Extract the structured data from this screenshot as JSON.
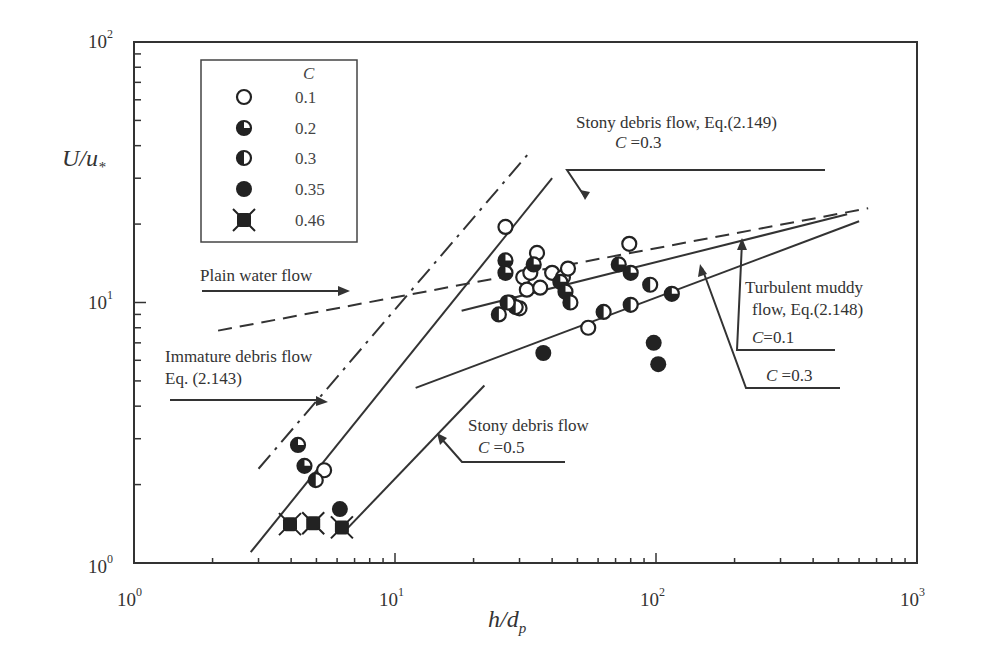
{
  "chart_data": {
    "type": "scatter",
    "title": "",
    "xlabel": "h/d_p",
    "ylabel": "U/u_*",
    "xscale": "log",
    "yscale": "log",
    "xlim": [
      1,
      1000
    ],
    "ylim": [
      1,
      100
    ],
    "x_ticks": [
      "10^0",
      "10^1",
      "10^2",
      "10^3"
    ],
    "y_ticks": [
      "10^0",
      "10^1",
      "10^2"
    ],
    "grid": false,
    "legend": {
      "title": "C",
      "position": "upper-left",
      "entries": [
        {
          "marker": "open-circle",
          "label": "0.1"
        },
        {
          "marker": "quarter-filled-circle",
          "label": "0.2"
        },
        {
          "marker": "half-filled-circle",
          "label": "0.3"
        },
        {
          "marker": "filled-circle",
          "label": "0.35"
        },
        {
          "marker": "filled-star-square",
          "label": "0.46"
        }
      ]
    },
    "series": [
      {
        "name": "C=0.1",
        "marker": "open-circle",
        "points": [
          [
            26.5,
            19.5
          ],
          [
            5.35,
            2.27
          ],
          [
            27.5,
            10
          ],
          [
            30,
            9.5
          ],
          [
            31,
            12.5
          ],
          [
            32,
            11.2
          ],
          [
            33,
            13
          ],
          [
            35,
            15.5
          ],
          [
            36,
            11.4
          ],
          [
            40,
            13
          ],
          [
            44,
            12.5
          ],
          [
            46,
            13.5
          ],
          [
            79,
            16.8
          ],
          [
            55,
            8
          ]
        ]
      },
      {
        "name": "C=0.2",
        "marker": "quarter-filled-circle",
        "points": [
          [
            4.25,
            2.84
          ],
          [
            4.5,
            2.36
          ],
          [
            26.5,
            14.5
          ],
          [
            26.5,
            13
          ],
          [
            34,
            14
          ],
          [
            43,
            12
          ],
          [
            45,
            11
          ],
          [
            72,
            14
          ],
          [
            80,
            13
          ],
          [
            115,
            10.8
          ]
        ]
      },
      {
        "name": "C=0.3",
        "marker": "half-filled-circle",
        "points": [
          [
            4.97,
            2.08
          ],
          [
            25,
            9
          ],
          [
            29,
            9.6
          ],
          [
            47,
            10
          ],
          [
            63,
            9.2
          ],
          [
            80,
            9.8
          ],
          [
            95,
            11.7
          ],
          [
            27,
            10
          ]
        ]
      },
      {
        "name": "C=0.35",
        "marker": "filled-circle",
        "points": [
          [
            6.15,
            1.61
          ],
          [
            37,
            6.4
          ],
          [
            98,
            7.0
          ],
          [
            102,
            5.8
          ]
        ]
      },
      {
        "name": "C=0.46",
        "marker": "filled-star-square",
        "points": [
          [
            3.96,
            1.41
          ],
          [
            4.86,
            1.42
          ],
          [
            6.26,
            1.37
          ]
        ]
      }
    ],
    "curves": [
      {
        "name": "Plain water flow",
        "style": "dashed",
        "points": [
          [
            2.1,
            7.8
          ],
          [
            650,
            23
          ]
        ]
      },
      {
        "name": "Immature debris flow Eq. (2.143)",
        "style": "dash-dot",
        "points": [
          [
            3.0,
            2.3
          ],
          [
            33,
            38
          ]
        ]
      },
      {
        "name": "Stony debris flow, Eq.(2.149) C=0.3",
        "style": "solid",
        "points": [
          [
            2.8,
            1.1
          ],
          [
            40,
            30
          ]
        ]
      },
      {
        "name": "Turbulent muddy flow C=0.1",
        "style": "solid",
        "points": [
          [
            18,
            9.3
          ],
          [
            540,
            21.8
          ]
        ]
      },
      {
        "name": "Turbulent muddy flow C=0.3",
        "style": "solid",
        "points": [
          [
            12,
            4.7
          ],
          [
            600,
            20.5
          ]
        ]
      },
      {
        "name": "Stony debris flow C=0.5",
        "style": "solid",
        "points": [
          [
            6.3,
            1.3
          ],
          [
            22,
            4.8
          ]
        ]
      }
    ],
    "annotations": [
      "Stony debris flow, Eq.(2.149)",
      "C =0.3",
      "Plain water flow",
      "Immature debris flow",
      "Eq. (2.143)",
      "Turbulent muddy",
      "flow, Eq.(2.148)",
      "C =0.1",
      "C =0.3",
      "Stony debris flow",
      "C =0.5"
    ]
  },
  "labels": {
    "xlabel_main": "h/d",
    "xlabel_sub": "p",
    "ylabel_main": "U/u",
    "ylabel_sub": "*",
    "legend_title": "C",
    "legend": [
      "0.1",
      "0.2",
      "0.3",
      "0.35",
      "0.46"
    ],
    "xticks": [
      {
        "base": "10",
        "exp": "0"
      },
      {
        "base": "10",
        "exp": "1"
      },
      {
        "base": "10",
        "exp": "2"
      },
      {
        "base": "10",
        "exp": "3"
      }
    ],
    "yticks": [
      {
        "base": "10",
        "exp": "0"
      },
      {
        "base": "10",
        "exp": "1"
      },
      {
        "base": "10",
        "exp": "2"
      }
    ],
    "ann_stony_149": "Stony debris flow, Eq.(2.149)",
    "ann_c03_top": "=0.3",
    "ann_plain": "Plain water flow",
    "ann_immature1": "Immature debris flow",
    "ann_immature2": "Eq. (2.143)",
    "ann_turb1": "Turbulent muddy",
    "ann_turb2": "flow, Eq.(2.148)",
    "ann_c01": "=0.1",
    "ann_c03": "=0.3",
    "ann_stony": "Stony debris flow",
    "ann_c05": "=0.5",
    "c_symbol": "C"
  }
}
